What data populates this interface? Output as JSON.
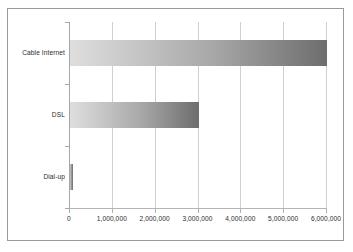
{
  "chart_data": {
    "type": "bar",
    "orientation": "horizontal",
    "title": "",
    "xlabel": "",
    "ylabel": "",
    "categories": [
      "Cable Internet",
      "DSL",
      "Dial-up"
    ],
    "values": [
      6000000,
      3000000,
      60000
    ],
    "series": [
      {
        "name": "Subscribers",
        "values": [
          6000000,
          3000000,
          60000
        ]
      }
    ],
    "xlim": [
      0,
      6000000
    ],
    "xticks": [
      0,
      1000000,
      2000000,
      3000000,
      4000000,
      5000000,
      6000000
    ],
    "xtick_labels": [
      "0",
      "1,000,000",
      "2,000,000",
      "3,000,000",
      "4,000,000",
      "5,000,000",
      "6,000,000"
    ],
    "grid": "vertical",
    "legend": "none",
    "bar_gradient": {
      "start": "#dedede",
      "end": "#6d6d6d",
      "direction": "left-to-right"
    },
    "colors": {
      "gridline": "#d0d0d0",
      "axis": "#9b9b9b",
      "frame_border": "#9a9a9a",
      "text": "#2b2b2b",
      "background": "#ffffff"
    }
  },
  "axis": {
    "x_tick_labels": [
      "0",
      "1,000,000",
      "2,000,000",
      "3,000,000",
      "4,000,000",
      "5,000,000",
      "6,000,000"
    ],
    "category_labels": [
      "Cable Internet",
      "DSL",
      "Dial-up"
    ]
  }
}
